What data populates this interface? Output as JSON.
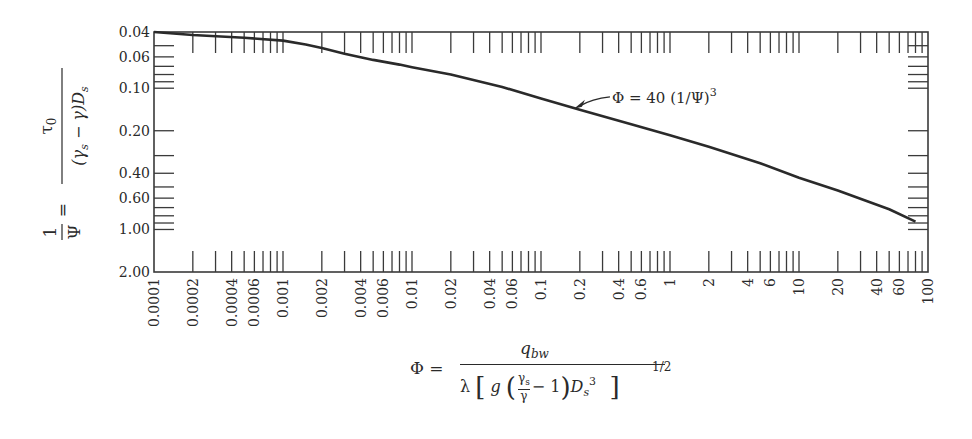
{
  "chart_data": {
    "type": "line",
    "title": "",
    "xlabel": "Φ = q_bw / ( λ [ g (γs/γ − 1) Ds^3 ]^(1/2) )",
    "ylabel": "1/Ψ = τ0 / ((γs − γ) Ds)",
    "xscale": "log",
    "yscale": "log",
    "y_inverted": true,
    "xlim": [
      0.0001,
      100
    ],
    "ylim": [
      0.04,
      2.0
    ],
    "grid": false,
    "x_tick_labels": [
      "0.0001",
      "0.0002",
      "0.0004",
      "0.0006",
      "0.001",
      "0.002",
      "0.004",
      "0.006",
      "0.01",
      "0.02",
      "0.04",
      "0.06",
      "0.1",
      "0.2",
      "0.4",
      "0.6",
      "1",
      "2",
      "4",
      "6",
      "10",
      "20",
      "40",
      "60",
      "100"
    ],
    "x_tick_values": [
      0.0001,
      0.0002,
      0.0004,
      0.0006,
      0.001,
      0.002,
      0.004,
      0.006,
      0.01,
      0.02,
      0.04,
      0.06,
      0.1,
      0.2,
      0.4,
      0.6,
      1,
      2,
      4,
      6,
      10,
      20,
      40,
      60,
      100
    ],
    "y_tick_labels": [
      "0.04",
      "0.06",
      "0.10",
      "0.20",
      "0.40",
      "0.60",
      "1.00",
      "2.00"
    ],
    "y_tick_values": [
      0.04,
      0.06,
      0.1,
      0.2,
      0.4,
      0.6,
      1.0,
      2.0
    ],
    "series": [
      {
        "name": "Φ = 40 (1/Ψ)^3",
        "x": [
          0.0001,
          0.0002,
          0.0005,
          0.001,
          0.0015,
          0.002,
          0.003,
          0.005,
          0.008,
          0.01,
          0.02,
          0.05,
          0.1,
          0.2,
          0.5,
          1,
          2,
          5,
          10,
          20,
          50,
          80
        ],
        "y": [
          0.04,
          0.042,
          0.044,
          0.046,
          0.049,
          0.052,
          0.057,
          0.063,
          0.068,
          0.071,
          0.08,
          0.098,
          0.118,
          0.142,
          0.18,
          0.215,
          0.26,
          0.34,
          0.43,
          0.53,
          0.72,
          0.88
        ]
      }
    ],
    "annotations": [
      {
        "text": "Φ = 40 (1/Ψ)³",
        "arrow_to": [
          0.18,
          0.14
        ]
      }
    ]
  },
  "labels": {
    "y_num": "τ",
    "y_num_sub": "0",
    "y_den": "(γ",
    "y_den_sub": "s",
    "y_den_rest": " − γ)D",
    "y_den_sub2": "s",
    "y_lhs_num": "1",
    "y_lhs_den": "Ψ",
    "y_eq": "=",
    "annotation": "Φ = 40 (1/Ψ)",
    "annotation_sup": "3",
    "x_lhs": "Φ =",
    "x_num": "q",
    "x_num_sub": "bw",
    "x_den_lambda": "λ",
    "x_den_g": "g",
    "x_frac_top": "γs",
    "x_frac_bot": "γ",
    "x_den_minus": "− 1",
    "x_den_D": "D",
    "x_den_D_sub": "s",
    "x_den_D_sup": "3",
    "x_pow": "1/2"
  },
  "colors": {
    "line": "#2a2a2a",
    "frame": "#3a3a3a",
    "text": "#2a2a2a"
  }
}
